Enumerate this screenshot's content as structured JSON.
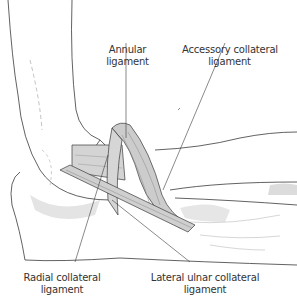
{
  "figure": {
    "colors": {
      "line": "#3a3a3a",
      "ligament_fill": "#d4d4d4",
      "bone_shadow": "#e2e2e2",
      "background": "#ffffff"
    },
    "labels": [
      {
        "id": "annular",
        "line1": "Annular",
        "line2": "ligament"
      },
      {
        "id": "accessory",
        "line1": "Accessory collateral",
        "line2": "ligament"
      },
      {
        "id": "radial",
        "line1": "Radial collateral",
        "line2": "ligament"
      },
      {
        "id": "lucl",
        "line1": "Lateral ulnar collateral",
        "line2": "ligament"
      }
    ]
  }
}
